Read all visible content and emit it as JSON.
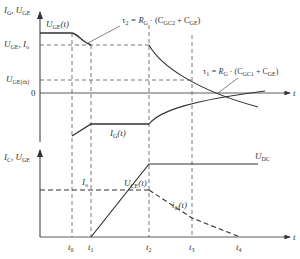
{
  "top_chart": {
    "y_axis_label": "I_G, U_GE",
    "y_axis_label_main": "I",
    "y_axis_label_sub1": "G",
    "y_axis_label_sep": ", U",
    "y_axis_label_sub2": "GE",
    "x_axis_label": "t",
    "levels": {
      "uge_io": {
        "main": "U",
        "sub": "GE",
        "tail": ", I",
        "sub2": "o"
      },
      "uge_th": {
        "main": "U",
        "sub": "GE(th)"
      },
      "zero": "0"
    },
    "curve_labels": {
      "uge_t": {
        "main": "U",
        "sub": "GE",
        "tail": "(t)"
      },
      "ig_t": {
        "main": "I",
        "sub": "G",
        "tail": "(t)"
      }
    },
    "annotations": {
      "tau2": {
        "text": "τ2 = RG · (CGC2 + CGE)",
        "tau": "τ",
        "tau_sub": "2",
        "eq": " = R",
        "r_sub": "G",
        "mid": " · (C",
        "c1_sub": "GC2",
        "plus": " + C",
        "c2_sub": "GE",
        "close": ")"
      },
      "tau1": {
        "text": "τ1 = RG · (CGC1 + CGE)",
        "tau": "τ",
        "tau_sub": "1",
        "eq": " = R",
        "r_sub": "G",
        "mid": " · (C",
        "c1_sub": "GC1",
        "plus": " + C",
        "c2_sub": "GE",
        "close": ")"
      }
    }
  },
  "bottom_chart": {
    "y_axis_label_main": "I",
    "y_axis_label_sub1": "C",
    "y_axis_label_sep": ", U",
    "y_axis_label_sub2": "GE",
    "x_axis_label": "t",
    "levels": {
      "io": {
        "main": "I",
        "sub": "o"
      },
      "udc": {
        "main": "U",
        "sub": "DC"
      }
    },
    "curve_labels": {
      "uce_t": {
        "main": "U",
        "sub": "CE",
        "tail": "(t)"
      },
      "ic_t": {
        "main": "i",
        "sub": "C",
        "tail": "(t)"
      }
    },
    "time_ticks": [
      {
        "main": "t",
        "sub": "0"
      },
      {
        "main": "t",
        "sub": "1"
      },
      {
        "main": "t",
        "sub": "2"
      },
      {
        "main": "t",
        "sub": "3"
      },
      {
        "main": "t",
        "sub": "4"
      }
    ]
  },
  "colors": {
    "line": "#333333",
    "dashed": "#555555"
  }
}
